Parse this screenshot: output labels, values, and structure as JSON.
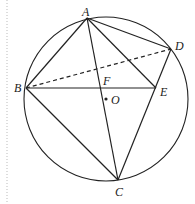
{
  "diagram": {
    "type": "circle-geometry",
    "circle": {
      "center_label": "O",
      "cx": 106,
      "cy": 99,
      "r": 82
    },
    "points": {
      "A": {
        "x": 87,
        "y": 18,
        "label": "A",
        "lx": 82,
        "ly": 16
      },
      "B": {
        "x": 26,
        "y": 88,
        "label": "B",
        "lx": 14,
        "ly": 92
      },
      "C": {
        "x": 118,
        "y": 180,
        "label": "C",
        "lx": 115,
        "ly": 196
      },
      "D": {
        "x": 171,
        "y": 49,
        "label": "D",
        "lx": 175,
        "ly": 50
      },
      "E": {
        "x": 156,
        "y": 88,
        "label": "E",
        "lx": 160,
        "ly": 96
      },
      "F": {
        "x": 100,
        "y": 88,
        "label": "F",
        "lx": 103,
        "ly": 85
      },
      "O": {
        "x": 106,
        "y": 99,
        "label": "O",
        "lx": 111,
        "ly": 104
      }
    },
    "solid_segments": [
      [
        "A",
        "B"
      ],
      [
        "A",
        "C"
      ],
      [
        "A",
        "D"
      ],
      [
        "A",
        "E"
      ],
      [
        "B",
        "E"
      ],
      [
        "B",
        "C"
      ],
      [
        "C",
        "D"
      ]
    ],
    "dashed_segments": [
      [
        "B",
        "D"
      ]
    ],
    "labels": {
      "A": "A",
      "B": "B",
      "C": "C",
      "D": "D",
      "E": "E",
      "F": "F",
      "O": "O"
    }
  }
}
